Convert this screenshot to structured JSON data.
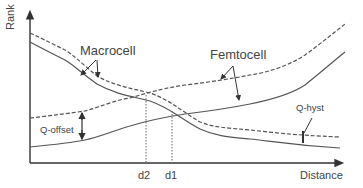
{
  "diagram": {
    "type": "handover-rank-vs-distance",
    "axes": {
      "y_label": "Rank",
      "x_label": "Distance"
    },
    "curves": {
      "macrocell": {
        "label": "Macrocell",
        "series": [
          "dashed (with Q-hyst)",
          "solid"
        ]
      },
      "femtocell": {
        "label": "Femtocell",
        "series": [
          "dashed (with Q-offset)",
          "solid"
        ]
      }
    },
    "annotations": {
      "q_offset": "Q-offset",
      "q_hyst": "Q-hyst"
    },
    "markers": {
      "d2": "d2",
      "d1": "d1"
    },
    "colors": {
      "line": "#555555",
      "text": "#444444",
      "background": "#ffffff"
    }
  }
}
